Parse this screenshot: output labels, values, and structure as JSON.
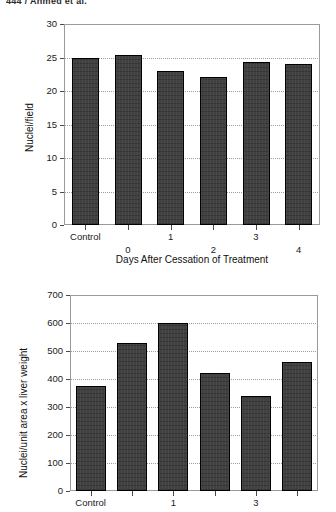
{
  "page": {
    "running_header": "444 / Ahmed et al."
  },
  "chart_data": [
    {
      "id": "top",
      "type": "bar",
      "title": "",
      "xlabel": "Days After Cessation of Treatment",
      "ylabel": "Nuclei/field",
      "categories": [
        "Control",
        "0",
        "1",
        "2",
        "3",
        "4"
      ],
      "values": [
        25.0,
        25.4,
        23.0,
        22.1,
        24.3,
        24.0
      ],
      "ylim": [
        0,
        30
      ],
      "yticks": [
        0,
        5,
        10,
        15,
        20,
        25,
        30
      ],
      "ytick_labels": [
        "0",
        "5",
        "10",
        "15",
        "20",
        "25",
        "30"
      ],
      "grid": true,
      "legend": "none",
      "bar_color": "#3b3b3b",
      "bar_edge_color": "#000000",
      "frame_color": "#9a9a9a"
    },
    {
      "id": "bottom",
      "type": "bar",
      "title": "",
      "xlabel": "",
      "ylabel": "Nuclei/unit area x liver weight",
      "categories": [
        "Control",
        "0",
        "1",
        "2",
        "3",
        "4"
      ],
      "visible_tick_labels": [
        "Control",
        "1",
        "3"
      ],
      "values": [
        375,
        530,
        600,
        420,
        340,
        460
      ],
      "ylim": [
        0,
        700
      ],
      "yticks": [
        0,
        100,
        200,
        300,
        400,
        500,
        600,
        700
      ],
      "ytick_labels": [
        "0",
        "100",
        "200",
        "300",
        "400",
        "500",
        "600",
        "700"
      ],
      "grid": true,
      "legend": "none",
      "bar_color": "#3b3b3b",
      "bar_edge_color": "#000000",
      "frame_color": "#9a9a9a"
    }
  ]
}
